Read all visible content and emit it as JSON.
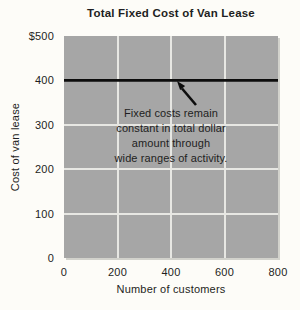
{
  "chart_data": {
    "type": "line",
    "title": "Total Fixed Cost of Van Lease",
    "xlabel": "Number of customers",
    "ylabel": "Cost of van lease",
    "xlim": [
      0,
      800
    ],
    "ylim": [
      0,
      500
    ],
    "grid": true,
    "grid_x": [
      200,
      400,
      600
    ],
    "grid_y": [
      100,
      200,
      300,
      400
    ],
    "x_ticks": [
      {
        "label": "0",
        "value": 0
      },
      {
        "label": "200",
        "value": 200
      },
      {
        "label": "400",
        "value": 400
      },
      {
        "label": "600",
        "value": 600
      },
      {
        "label": "800",
        "value": 800
      }
    ],
    "y_ticks": [
      {
        "label": "$500",
        "value": 500
      },
      {
        "label": "400",
        "value": 400
      },
      {
        "label": "300",
        "value": 300
      },
      {
        "label": "200",
        "value": 200
      },
      {
        "label": "100",
        "value": 100
      },
      {
        "label": "0",
        "value": 0
      }
    ],
    "series": [
      {
        "name": "Total fixed cost",
        "x": [
          0,
          800
        ],
        "y": [
          400,
          400
        ],
        "color": "#0d0d0d"
      }
    ],
    "annotation": {
      "text": "Fixed costs remain constant in total dollar amount through wide ranges of activity.",
      "lines": [
        "Fixed costs remain",
        "constant in total dollar",
        "amount through",
        "wide ranges of activity."
      ],
      "arrow_points_to": {
        "x": 420,
        "y": 400
      }
    },
    "legend": "none",
    "colors": {
      "background": "#fdfcf8",
      "plot_background": "#a6a6a6",
      "gridline": "#e7e7e3",
      "line": "#0d0d0d",
      "text": "#1e1e22",
      "plot_edge": "#d2d2cc"
    }
  }
}
